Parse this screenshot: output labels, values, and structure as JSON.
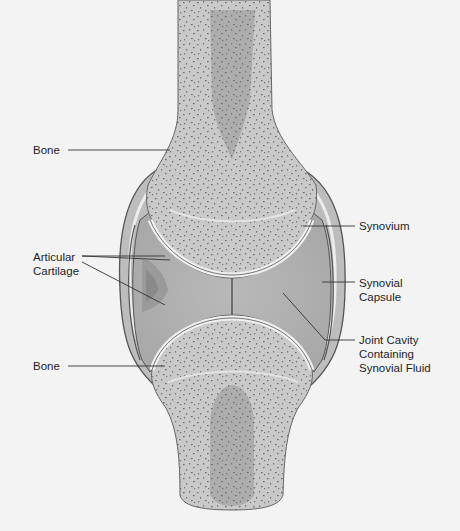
{
  "diagram": {
    "colors": {
      "background": "#f3f3f3",
      "bone": "#c9c9c9",
      "marrow": "#a9a9a9",
      "capsule": "#bdbdbd",
      "cavity": "#b5b5b5",
      "cartilage": "#e6e6e6",
      "outline": "#555555",
      "speckle": "#707070"
    },
    "labels": {
      "bone_top": "Bone",
      "articular_cartilage": "Articular\nCartilage",
      "bone_bottom": "Bone",
      "synovium": "Synovium",
      "synovial_capsule": "Synovial\nCapsule",
      "joint_cavity": "Joint Cavity\nContaining\nSynovial Fluid"
    }
  }
}
